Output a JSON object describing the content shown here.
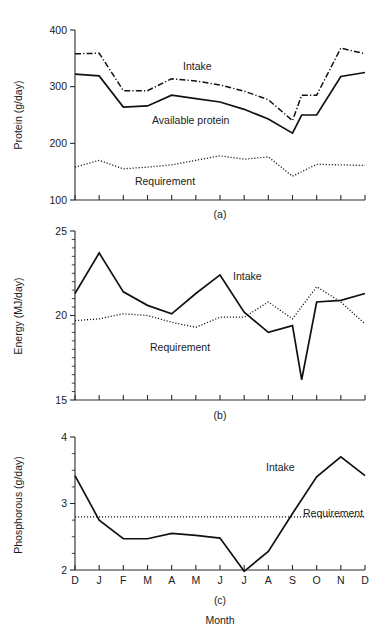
{
  "figure": {
    "x_axis_title": "Month",
    "months": [
      "D",
      "J",
      "F",
      "M",
      "A",
      "M",
      "J",
      "J",
      "A",
      "S",
      "O",
      "N",
      "D"
    ]
  },
  "chart_data": [
    {
      "type": "line",
      "panel": "(a)",
      "title": "",
      "xlabel": "Month",
      "ylabel": "Protein (g/day)",
      "ylim": [
        100,
        400
      ],
      "yticks": [
        100,
        200,
        300,
        400
      ],
      "ytick_labels": [
        "100",
        "200",
        "300",
        "400"
      ],
      "grid": false,
      "legend_position": "inline-annotation",
      "x": [
        "D",
        "J",
        "F",
        "M",
        "A",
        "M",
        "J",
        "J",
        "A",
        "S",
        "O",
        "N",
        "D"
      ],
      "series": [
        {
          "name": "Intake",
          "style": "dash-dot",
          "label_x": "M",
          "values": [
            358,
            359,
            293,
            293,
            314,
            310,
            303,
            292,
            277,
            240,
            285,
            285,
            368,
            358
          ]
        },
        {
          "name": "Available protein",
          "style": "solid",
          "label_x": "A",
          "values": [
            322,
            319,
            264,
            266,
            285,
            279,
            273,
            260,
            243,
            218,
            250,
            250,
            318,
            325
          ]
        },
        {
          "name": "Requirement",
          "style": "dotted",
          "label_x": "M",
          "values": [
            158,
            170,
            155,
            158,
            162,
            170,
            178,
            172,
            176,
            142,
            163,
            162,
            161
          ]
        }
      ]
    },
    {
      "type": "line",
      "panel": "(b)",
      "title": "",
      "xlabel": "Month",
      "ylabel": "Energy (MJ/day)",
      "ylim": [
        15,
        25
      ],
      "yticks": [
        15,
        20,
        25
      ],
      "ytick_labels": [
        "15",
        "20",
        "25"
      ],
      "grid": false,
      "legend_position": "inline-annotation",
      "x": [
        "D",
        "J",
        "F",
        "M",
        "A",
        "M",
        "J",
        "J",
        "A",
        "S",
        "O",
        "N",
        "D"
      ],
      "series": [
        {
          "name": "Intake",
          "style": "solid",
          "label_x": "J",
          "values": [
            21.3,
            23.7,
            21.4,
            20.6,
            20.1,
            21.3,
            22.4,
            20.2,
            19.0,
            19.4,
            16.2,
            20.8,
            20.9,
            21.3
          ]
        },
        {
          "name": "Requirement",
          "style": "dotted",
          "label_x": "A",
          "values": [
            19.7,
            19.8,
            20.1,
            20.0,
            19.6,
            19.3,
            19.9,
            19.9,
            20.8,
            19.8,
            21.7,
            20.8,
            19.5
          ]
        }
      ]
    },
    {
      "type": "line",
      "panel": "(c)",
      "title": "",
      "xlabel": "Month",
      "ylabel": "Phosphorous (g/day)",
      "ylim": [
        2,
        4
      ],
      "yticks": [
        2,
        3,
        4
      ],
      "ytick_labels": [
        "2",
        "3",
        "4"
      ],
      "grid": false,
      "legend_position": "inline-annotation",
      "x": [
        "D",
        "J",
        "F",
        "M",
        "A",
        "M",
        "J",
        "J",
        "A",
        "S",
        "O",
        "N",
        "D"
      ],
      "series": [
        {
          "name": "Intake",
          "style": "solid",
          "label_x": "S",
          "values": [
            3.42,
            2.75,
            2.47,
            2.47,
            2.55,
            2.52,
            2.48,
            1.98,
            2.28,
            2.85,
            3.4,
            3.7,
            3.42
          ]
        },
        {
          "name": "Requirement",
          "style": "dotted",
          "label_x": "O",
          "values": [
            2.8,
            2.8,
            2.8,
            2.8,
            2.8,
            2.8,
            2.8,
            2.8,
            2.8,
            2.8,
            2.8,
            2.8,
            2.8
          ]
        }
      ]
    }
  ]
}
